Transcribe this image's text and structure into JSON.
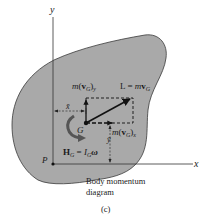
{
  "diagram": {
    "caption_line1": "Body momentum",
    "caption_line2": "diagram",
    "figure_label": "(c)",
    "axes": {
      "x_label": "x",
      "y_label": "y",
      "origin_label": "P"
    },
    "points": {
      "center_of_mass": "G"
    },
    "labels": {
      "linear_momentum": {
        "lhs": "L",
        "eq": "=",
        "m": "m",
        "v": "v",
        "sub": "G"
      },
      "momentum_y": {
        "m": "m",
        "open": "(",
        "v": "v",
        "sub": "G",
        "close": ")",
        "comp": "y"
      },
      "momentum_x": {
        "m": "m",
        "open": "(",
        "v": "v",
        "sub": "G",
        "close": ")",
        "comp": "x"
      },
      "angular_momentum": {
        "H": "H",
        "Hsub": "G",
        "eq": "=",
        "I": "I",
        "Isub": "G",
        "omega": "ω"
      },
      "x_bar": "x̄",
      "y_bar": "ȳ"
    },
    "colors": {
      "body_fill": "#a9a9a9",
      "body_stroke": "#3a3a3a",
      "line": "#222222",
      "background": "#ffffff"
    }
  }
}
